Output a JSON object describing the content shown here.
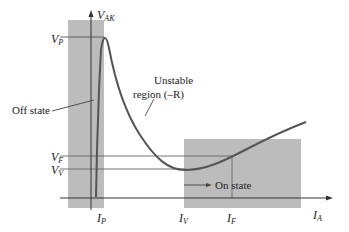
{
  "diagram": {
    "axes": {
      "y_label": {
        "main": "V",
        "sub": "AK"
      },
      "x_label": {
        "main": "I",
        "sub": "A"
      }
    },
    "voltage_levels": [
      {
        "main": "V",
        "sub": "P"
      },
      {
        "main": "V",
        "sub": "F"
      },
      {
        "main": "V",
        "sub": "V"
      }
    ],
    "current_levels": [
      {
        "main": "I",
        "sub": "P"
      },
      {
        "main": "I",
        "sub": "V"
      },
      {
        "main": "I",
        "sub": "F"
      }
    ],
    "annotations": {
      "off_state": "Off state",
      "unstable_line1": "Unstable",
      "unstable_line2": "region (–R)",
      "on_state": "On state"
    },
    "colors": {
      "shade": "#b9b9b9",
      "curve": "#555555",
      "axis": "#333333"
    }
  }
}
